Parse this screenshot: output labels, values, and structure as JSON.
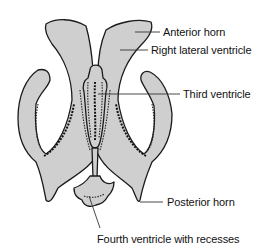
{
  "figure": {
    "fill_color": "#cfcfcf",
    "outline_color": "#1a1a1a",
    "labels": [
      {
        "id": "anterior_horn",
        "text": "Anterior horn"
      },
      {
        "id": "right_lateral_ventricle",
        "text": "Right lateral ventricle"
      },
      {
        "id": "third_ventricle",
        "text": "Third ventricle"
      },
      {
        "id": "posterior_horn",
        "text": "Posterior horn"
      },
      {
        "id": "fourth_ventricle",
        "text": "Fourth ventricle with recesses"
      }
    ]
  }
}
